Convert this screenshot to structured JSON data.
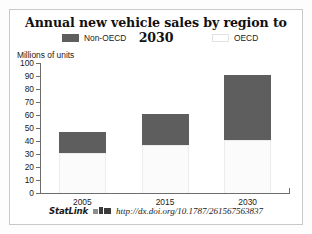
{
  "figure": {
    "title": "Annual new vehicle sales by region to 2030",
    "axis_title": "Millions of units"
  },
  "legend": {
    "entries": [
      {
        "label": "Non-OECD",
        "swatch": "dark",
        "color": "#5e5e5e"
      },
      {
        "label": "OECD",
        "swatch": "light",
        "color": "#ffffff"
      }
    ]
  },
  "statlink": {
    "word": "StatLink",
    "icon": "statlink-barcode-icon",
    "url": "http://dx.doi.org/10.1787/261567563837"
  },
  "chart_data": {
    "type": "bar",
    "stacked": true,
    "title": "Annual new vehicle sales by region to 2030",
    "xlabel": "",
    "ylabel": "Millions of units",
    "ylim": [
      0,
      100
    ],
    "yticks": [
      0,
      10,
      20,
      30,
      40,
      50,
      60,
      70,
      80,
      90,
      100
    ],
    "grid": false,
    "legend_position": "top",
    "categories": [
      "2005",
      "2015",
      "2030"
    ],
    "series": [
      {
        "name": "OECD",
        "color": "#ffffff",
        "values": [
          31,
          37,
          41
        ]
      },
      {
        "name": "Non-OECD",
        "color": "#5e5e5e",
        "values": [
          16,
          24,
          50
        ]
      }
    ],
    "totals": [
      47,
      61,
      91
    ]
  }
}
